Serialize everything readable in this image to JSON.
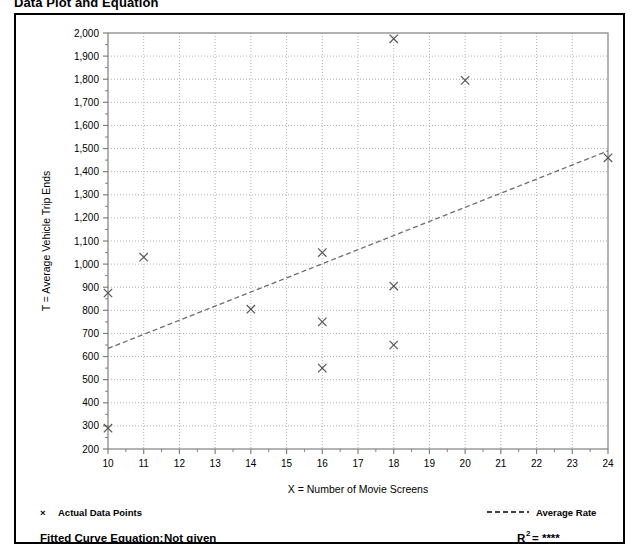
{
  "title": "Data Plot and Equation",
  "legend": {
    "data_points_label": "Actual Data Points",
    "average_rate_label": "Average Rate",
    "marker_icon": "x-cross-icon",
    "line_icon": "dashed-line-icon"
  },
  "footer": {
    "fitted_curve_label": "Fitted Curve Equation:",
    "fitted_curve_value": "Not given",
    "r2_label": "R",
    "r2_superscript": "2",
    "r2_value": "= ****"
  },
  "colors": {
    "frame": "#000000",
    "grid": "#b0b0b0",
    "axis": "#808080",
    "marker": "#555555",
    "trend": "#6e6e6e"
  },
  "chart_data": {
    "type": "scatter",
    "title": "Data Plot and Equation",
    "xlabel": "X = Number of Movie Screens",
    "ylabel": "T = Average Vehicle Trip Ends",
    "xlim": [
      10,
      24
    ],
    "ylim": [
      200,
      2000
    ],
    "xticks": [
      10,
      11,
      12,
      13,
      14,
      15,
      16,
      17,
      18,
      19,
      20,
      21,
      22,
      23,
      24
    ],
    "xtick_labels": [
      "10",
      "11",
      "12",
      "13",
      "14",
      "15",
      "16",
      "17",
      "18",
      "19",
      "20",
      "21",
      "22",
      "23",
      "24"
    ],
    "yticks": [
      200,
      300,
      400,
      500,
      600,
      700,
      800,
      900,
      1000,
      1100,
      1200,
      1300,
      1400,
      1500,
      1600,
      1700,
      1800,
      1900,
      2000
    ],
    "ytick_labels": [
      "200",
      "300",
      "400",
      "500",
      "600",
      "700",
      "800",
      "900",
      "1,000",
      "1,100",
      "1,200",
      "1,300",
      "1,400",
      "1,500",
      "1,600",
      "1,700",
      "1,800",
      "1,900",
      "2,000"
    ],
    "grid": true,
    "legend_position": "below-plot",
    "series": [
      {
        "name": "Actual Data Points",
        "marker": "x",
        "points": [
          {
            "x": 10,
            "y": 875
          },
          {
            "x": 10,
            "y": 290
          },
          {
            "x": 11,
            "y": 1030
          },
          {
            "x": 14,
            "y": 805
          },
          {
            "x": 16,
            "y": 1050
          },
          {
            "x": 16,
            "y": 750
          },
          {
            "x": 16,
            "y": 550
          },
          {
            "x": 18,
            "y": 1975
          },
          {
            "x": 18,
            "y": 905
          },
          {
            "x": 18,
            "y": 650
          },
          {
            "x": 20,
            "y": 1795
          },
          {
            "x": 24,
            "y": 1460
          }
        ]
      },
      {
        "name": "Average Rate",
        "type": "line",
        "style": "dashed",
        "points": [
          {
            "x": 10,
            "y": 635
          },
          {
            "x": 24,
            "y": 1490
          }
        ]
      }
    ]
  }
}
